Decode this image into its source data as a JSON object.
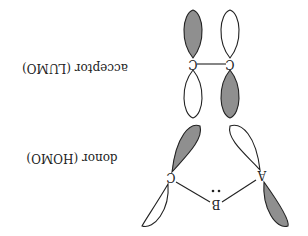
{
  "diagram": {
    "orientation": "rotated-180",
    "labels": {
      "acceptor": "acceptor (LUMO)",
      "donor": "donor (HOMO)"
    },
    "atoms": {
      "acceptor_left": "C",
      "acceptor_right": "C",
      "donor_a": "A",
      "donor_b": "B",
      "donor_c": "C",
      "lone_pair": "¨"
    },
    "colors": {
      "shaded_lobe": "#8f8f8f",
      "open_lobe": "#ffffff",
      "stroke": "#222222",
      "text": "#222222",
      "background": "#ffffff"
    }
  }
}
